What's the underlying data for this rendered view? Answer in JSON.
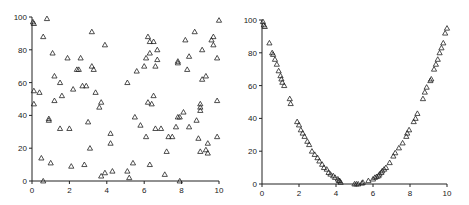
{
  "chart_data": [
    {
      "type": "scatter",
      "title": "",
      "xlabel": "",
      "ylabel": "",
      "xlim": [
        0,
        10
      ],
      "ylim": [
        0,
        100
      ],
      "xticks": [
        "0",
        "2",
        "4",
        "6",
        "8",
        "10"
      ],
      "yticks": [
        "0",
        "20",
        "40",
        "60",
        "80",
        "100"
      ],
      "grid": false,
      "marker": "triangle-open",
      "points": [
        [
          0.05,
          97
        ],
        [
          0.1,
          96
        ],
        [
          0.1,
          55
        ],
        [
          0.1,
          47
        ],
        [
          0.4,
          54
        ],
        [
          0.5,
          14
        ],
        [
          0.6,
          88
        ],
        [
          0.6,
          0
        ],
        [
          0.8,
          99
        ],
        [
          0.9,
          38
        ],
        [
          0.9,
          37
        ],
        [
          1.0,
          11
        ],
        [
          1.1,
          78
        ],
        [
          1.2,
          64
        ],
        [
          1.2,
          49
        ],
        [
          1.5,
          60
        ],
        [
          1.5,
          32
        ],
        [
          1.6,
          52
        ],
        [
          1.9,
          75
        ],
        [
          2.0,
          32
        ],
        [
          2.1,
          9
        ],
        [
          2.2,
          56
        ],
        [
          2.4,
          68
        ],
        [
          2.5,
          68
        ],
        [
          2.6,
          75
        ],
        [
          2.7,
          58
        ],
        [
          2.8,
          10
        ],
        [
          2.9,
          58
        ],
        [
          3.0,
          36
        ],
        [
          3.1,
          20
        ],
        [
          3.2,
          91
        ],
        [
          3.2,
          70
        ],
        [
          3.3,
          68
        ],
        [
          3.4,
          54
        ],
        [
          3.6,
          45
        ],
        [
          3.7,
          48
        ],
        [
          3.7,
          3
        ],
        [
          3.9,
          83
        ],
        [
          3.9,
          5
        ],
        [
          4.2,
          29
        ],
        [
          4.2,
          23
        ],
        [
          4.3,
          6
        ],
        [
          5.1,
          60
        ],
        [
          5.1,
          6
        ],
        [
          5.2,
          2
        ],
        [
          5.4,
          11
        ],
        [
          5.5,
          39
        ],
        [
          5.6,
          67
        ],
        [
          5.8,
          34
        ],
        [
          6.0,
          70
        ],
        [
          6.1,
          27
        ],
        [
          6.1,
          75
        ],
        [
          6.2,
          88
        ],
        [
          6.2,
          48
        ],
        [
          6.3,
          85
        ],
        [
          6.3,
          78
        ],
        [
          6.3,
          10
        ],
        [
          6.4,
          47
        ],
        [
          6.5,
          85
        ],
        [
          6.5,
          52
        ],
        [
          6.6,
          70
        ],
        [
          6.6,
          32
        ],
        [
          6.7,
          80
        ],
        [
          6.7,
          74
        ],
        [
          6.9,
          32
        ],
        [
          7.1,
          4
        ],
        [
          7.2,
          18
        ],
        [
          7.3,
          27
        ],
        [
          7.5,
          27
        ],
        [
          7.7,
          33
        ],
        [
          7.8,
          39
        ],
        [
          7.8,
          73
        ],
        [
          7.8,
          72
        ],
        [
          7.9,
          39
        ],
        [
          7.9,
          0
        ],
        [
          8.1,
          42
        ],
        [
          8.2,
          86
        ],
        [
          8.3,
          68
        ],
        [
          8.4,
          33
        ],
        [
          8.4,
          76
        ],
        [
          8.7,
          91
        ],
        [
          8.8,
          37
        ],
        [
          8.9,
          26
        ],
        [
          9.0,
          47
        ],
        [
          9.0,
          45
        ],
        [
          9.0,
          43
        ],
        [
          9.0,
          18
        ],
        [
          9.1,
          80
        ],
        [
          9.1,
          62
        ],
        [
          9.3,
          64
        ],
        [
          9.3,
          19
        ],
        [
          9.4,
          17
        ],
        [
          9.4,
          23
        ],
        [
          9.6,
          86
        ],
        [
          9.7,
          88
        ],
        [
          9.7,
          83
        ],
        [
          9.9,
          49
        ],
        [
          9.9,
          27
        ],
        [
          9.9,
          75
        ],
        [
          10.0,
          98
        ]
      ]
    },
    {
      "type": "scatter",
      "title": "",
      "xlabel": "",
      "ylabel": "",
      "xlim": [
        0,
        10
      ],
      "ylim": [
        0,
        100
      ],
      "xticks": [
        "0",
        "2",
        "4",
        "6",
        "8",
        "10"
      ],
      "yticks": [
        "0",
        "20",
        "40",
        "60",
        "80",
        "100"
      ],
      "grid": false,
      "marker": "triangle-open",
      "description": "points lying on a parabola y ≈ 4(x−5)²",
      "points": [
        [
          0.05,
          99
        ],
        [
          0.1,
          97
        ],
        [
          0.15,
          96
        ],
        [
          0.4,
          86
        ],
        [
          0.55,
          80
        ],
        [
          0.6,
          79
        ],
        [
          0.7,
          76
        ],
        [
          0.8,
          73
        ],
        [
          0.9,
          69
        ],
        [
          1.0,
          66
        ],
        [
          1.05,
          64
        ],
        [
          1.1,
          62
        ],
        [
          1.2,
          60
        ],
        [
          1.5,
          52
        ],
        [
          1.55,
          49
        ],
        [
          1.9,
          38
        ],
        [
          2.0,
          36
        ],
        [
          2.1,
          33
        ],
        [
          2.2,
          31
        ],
        [
          2.3,
          29
        ],
        [
          2.45,
          26
        ],
        [
          2.55,
          24
        ],
        [
          2.7,
          20
        ],
        [
          2.85,
          18
        ],
        [
          3.0,
          16
        ],
        [
          3.1,
          14
        ],
        [
          3.25,
          12
        ],
        [
          3.35,
          10
        ],
        [
          3.5,
          9
        ],
        [
          3.6,
          7
        ],
        [
          3.7,
          6
        ],
        [
          3.85,
          5
        ],
        [
          3.95,
          4
        ],
        [
          4.1,
          3
        ],
        [
          4.15,
          2
        ],
        [
          4.2,
          2
        ],
        [
          4.25,
          1
        ],
        [
          5.0,
          0
        ],
        [
          5.1,
          0
        ],
        [
          5.2,
          0
        ],
        [
          5.4,
          0.5
        ],
        [
          5.45,
          1
        ],
        [
          5.75,
          2
        ],
        [
          6.0,
          3
        ],
        [
          6.1,
          4
        ],
        [
          6.2,
          4.5
        ],
        [
          6.3,
          5
        ],
        [
          6.35,
          6
        ],
        [
          6.45,
          7
        ],
        [
          6.5,
          8
        ],
        [
          6.6,
          9
        ],
        [
          6.7,
          10
        ],
        [
          6.9,
          13
        ],
        [
          7.1,
          17
        ],
        [
          7.2,
          19
        ],
        [
          7.4,
          22
        ],
        [
          7.6,
          25
        ],
        [
          7.8,
          29
        ],
        [
          7.85,
          31
        ],
        [
          7.95,
          33
        ],
        [
          8.2,
          38
        ],
        [
          8.3,
          40
        ],
        [
          8.4,
          43
        ],
        [
          8.7,
          52
        ],
        [
          8.8,
          56
        ],
        [
          8.9,
          59
        ],
        [
          9.1,
          63
        ],
        [
          9.15,
          64
        ],
        [
          9.3,
          70
        ],
        [
          9.4,
          73
        ],
        [
          9.5,
          76
        ],
        [
          9.6,
          80
        ],
        [
          9.7,
          83
        ],
        [
          9.8,
          86
        ],
        [
          9.9,
          92
        ],
        [
          10.0,
          95
        ]
      ]
    }
  ]
}
